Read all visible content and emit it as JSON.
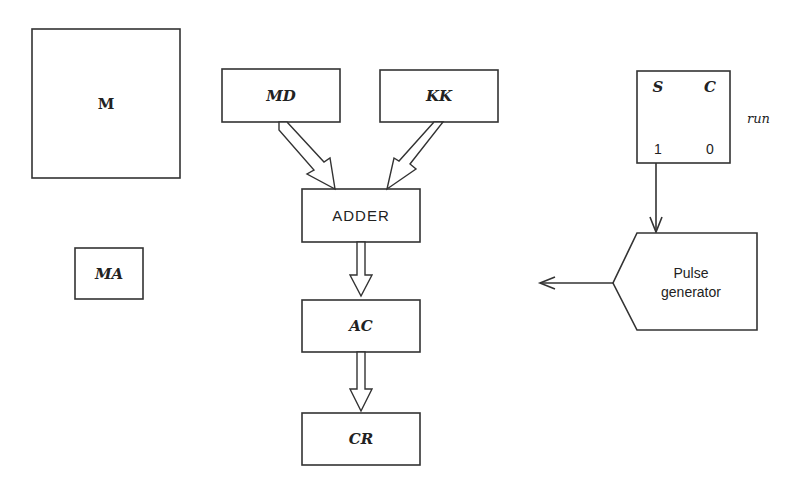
{
  "diagram": {
    "blocks": {
      "memory": {
        "label": "M"
      },
      "memory_address": {
        "label": "MA"
      },
      "memory_data": {
        "label": "MD"
      },
      "keys": {
        "label": "KK"
      },
      "adder": {
        "label": "ADDER"
      },
      "accumulator": {
        "label": "AC"
      },
      "control_register": {
        "label": "CR"
      },
      "pulse_generator": {
        "line1": "Pulse",
        "line2": "generator"
      }
    },
    "flipflop": {
      "set_label": "S",
      "clear_label": "C",
      "one_label": "1",
      "zero_label": "0",
      "name": "run"
    },
    "colors": {
      "stroke": "#333333",
      "background": "#ffffff"
    }
  }
}
